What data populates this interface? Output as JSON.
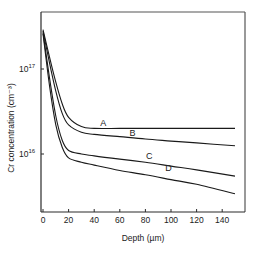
{
  "chart_data": {
    "type": "line",
    "title": "",
    "xlabel": "Depth (µm)",
    "ylabel": "Cr concentration (cm⁻³)",
    "xlim": [
      0,
      150
    ],
    "ylim": [
      2100000000000000.0,
      4.7e+17
    ],
    "yscale": "log",
    "grid": false,
    "legend": "inline labels on curves",
    "x_ticks": [
      0,
      20,
      40,
      60,
      80,
      100,
      120,
      140
    ],
    "x_tick_labels": [
      "0",
      "20",
      "40",
      "60",
      "80",
      "100",
      "120",
      "140"
    ],
    "y_ticks": [
      1e+16,
      1e+17
    ],
    "y_tick_labels": [
      {
        "base": "10",
        "exp": "16"
      },
      {
        "base": "10",
        "exp": "17"
      }
    ],
    "series": [
      {
        "name": "A",
        "x": [
          0,
          5,
          10,
          15,
          20,
          30,
          40,
          60,
          80,
          100,
          120,
          150
        ],
        "values": [
          2.9e+17,
          1.4e+17,
          7e+16,
          3.9e+16,
          2.7e+16,
          2.1e+16,
          2e+16,
          2e+16,
          2e+16,
          2e+16,
          2e+16,
          2e+16
        ],
        "label_pos": [
          47,
          2.05e+16
        ]
      },
      {
        "name": "B",
        "x": [
          0,
          5,
          10,
          15,
          20,
          30,
          40,
          60,
          80,
          100,
          120,
          150
        ],
        "values": [
          2.8e+17,
          1.2e+17,
          5.5e+16,
          3e+16,
          2.2e+16,
          1.8e+16,
          1.7e+16,
          1.6e+16,
          1.5e+16,
          1.42e+16,
          1.35e+16,
          1.25e+16
        ],
        "label_pos": [
          70,
          1.55e+16
        ]
      },
      {
        "name": "C",
        "x": [
          0,
          5,
          10,
          15,
          20,
          30,
          40,
          60,
          80,
          100,
          120,
          150
        ],
        "values": [
          2.7e+17,
          8e+16,
          2.8e+16,
          1.45e+16,
          1.1e+16,
          1e+16,
          9500000000000000.0,
          8700000000000000.0,
          8000000000000000.0,
          7200000000000000.0,
          6500000000000000.0,
          5500000000000000.0
        ],
        "label_pos": [
          83,
          8300000000000000.0
        ]
      },
      {
        "name": "D",
        "x": [
          0,
          5,
          10,
          15,
          20,
          30,
          40,
          60,
          80,
          100,
          120,
          150
        ],
        "values": [
          2.6e+17,
          6.5e+16,
          2.2e+16,
          1.2e+16,
          9000000000000000.0,
          8000000000000000.0,
          7400000000000000.0,
          6400000000000000.0,
          5700000000000000.0,
          5000000000000000.0,
          4400000000000000.0,
          3400000000000000.0
        ],
        "label_pos": [
          98,
          5900000000000000.0
        ]
      }
    ]
  },
  "labels": {
    "xlabel": "Depth (µm)",
    "ylabel": "Cr concentration (cm⁻³)"
  }
}
